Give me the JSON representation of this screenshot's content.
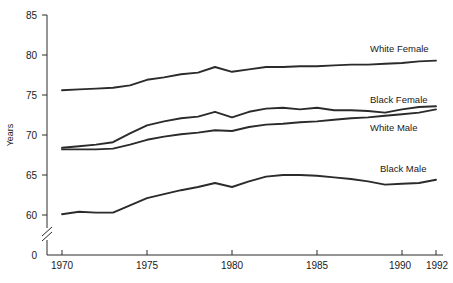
{
  "chart_data": {
    "type": "line",
    "title": "",
    "xlabel": "",
    "ylabel": "Years",
    "xlim": [
      1970,
      1992
    ],
    "ylim": [
      59,
      85
    ],
    "grid": false,
    "legend_position": "inline-right-of-line-ends",
    "axis_break": true,
    "y_ticks": [
      "0",
      "60",
      "65",
      "70",
      "75",
      "80",
      "85"
    ],
    "x_ticks": [
      "1970",
      "1975",
      "1980",
      "1985",
      "1990",
      "1992"
    ],
    "x": [
      1970,
      1971,
      1972,
      1973,
      1974,
      1975,
      1976,
      1977,
      1978,
      1979,
      1980,
      1981,
      1982,
      1983,
      1984,
      1985,
      1986,
      1987,
      1988,
      1989,
      1990,
      1991,
      1992
    ],
    "series": [
      {
        "name": "White Female",
        "label": "White Female",
        "color": "#2b2b2b",
        "values": [
          75.6,
          75.7,
          75.8,
          75.9,
          76.2,
          76.9,
          77.2,
          77.6,
          77.8,
          78.5,
          77.9,
          78.2,
          78.5,
          78.5,
          78.6,
          78.6,
          78.7,
          78.8,
          78.8,
          78.9,
          79.0,
          79.2,
          79.3
        ]
      },
      {
        "name": "Black Female",
        "label": "Black Female",
        "color": "#2b2b2b",
        "values": [
          68.4,
          68.6,
          68.8,
          69.1,
          70.2,
          71.2,
          71.7,
          72.1,
          72.3,
          72.9,
          72.2,
          72.9,
          73.3,
          73.4,
          73.2,
          73.4,
          73.1,
          73.1,
          73.0,
          72.8,
          73.2,
          73.5,
          73.6
        ]
      },
      {
        "name": "White Male",
        "label": "White Male",
        "color": "#2b2b2b",
        "values": [
          68.2,
          68.2,
          68.2,
          68.3,
          68.8,
          69.4,
          69.8,
          70.1,
          70.3,
          70.6,
          70.5,
          71.0,
          71.3,
          71.4,
          71.6,
          71.7,
          71.9,
          72.1,
          72.2,
          72.4,
          72.6,
          72.8,
          73.2
        ]
      },
      {
        "name": "Black Male",
        "label": "Black Male",
        "color": "#2b2b2b",
        "values": [
          60.1,
          60.4,
          60.3,
          60.3,
          61.2,
          62.1,
          62.6,
          63.1,
          63.5,
          64.0,
          63.5,
          64.2,
          64.8,
          65.0,
          65.0,
          64.9,
          64.7,
          64.5,
          64.2,
          63.8,
          63.9,
          64.0,
          64.4
        ]
      }
    ]
  },
  "axis": {
    "y_title": "Years",
    "y_tick_values": [
      85,
      80,
      75,
      70,
      65,
      60
    ],
    "y_zero_label": "0",
    "x_tick_values": [
      1970,
      1975,
      1980,
      1985,
      1990,
      1992
    ]
  }
}
